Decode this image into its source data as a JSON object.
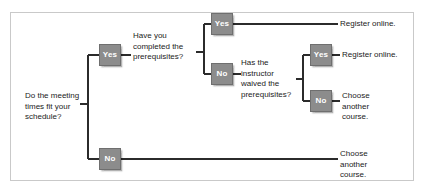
{
  "diagram": {
    "frame": {
      "border_color": "#c9c9c9",
      "background": "#ffffff"
    },
    "node_colors": {
      "fill": "#8c8c8c",
      "border": "#6f6f6f",
      "text": "#ffffff"
    },
    "line_color": "#2b2b2b",
    "text_color": "#1b1b1b"
  },
  "questions": {
    "root": "Do the meeting\ntimes fit your\nschedule?",
    "prerequisites": "Have you\ncompleted the\nprerequisites?",
    "waiver": "Has the\ninstructor\nwaived the\nprerequisites?"
  },
  "decisions": {
    "root_yes": "Yes",
    "root_no": "No",
    "prereq_yes": "Yes",
    "prereq_no": "No",
    "waiver_yes": "Yes",
    "waiver_no": "No"
  },
  "outcomes": {
    "register_top": "Register online.",
    "register_waiver": "Register online.",
    "choose_waiver_no": "Choose\nanother\ncourse.",
    "choose_root_no": "Choose\nanother\ncourse."
  }
}
